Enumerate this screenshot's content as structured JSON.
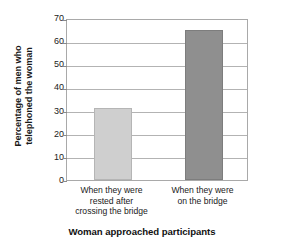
{
  "chart_data": {
    "type": "bar",
    "title": "",
    "xlabel": "Woman approached participants",
    "ylabel": "Percentage of men who telephoned the woman",
    "ylabel_lines": [
      "Percentage of men who",
      "telephoned the woman"
    ],
    "categories": [
      "When they were rested after crossing the bridge",
      "When they were on the bridge"
    ],
    "category_lines": [
      [
        "When they were",
        "rested after",
        "crossing the bridge"
      ],
      [
        "When they were",
        "on the bridge"
      ]
    ],
    "values": [
      31,
      65
    ],
    "ylim": [
      0,
      70
    ],
    "ytick_values": [
      0,
      10,
      20,
      30,
      40,
      50,
      60,
      70
    ],
    "ytick_labels": [
      "0",
      "10",
      "20",
      "30",
      "40",
      "50",
      "60",
      "70"
    ],
    "grid": true,
    "legend": false,
    "bar_colors": [
      "#cfcfcf",
      "#8f8f8f"
    ],
    "bar_edge_colors": [
      "#b5b5b5",
      "#7d7d7d"
    ],
    "axis_color": "#a9a9a9",
    "gridline_color": "#b3b3b3"
  }
}
